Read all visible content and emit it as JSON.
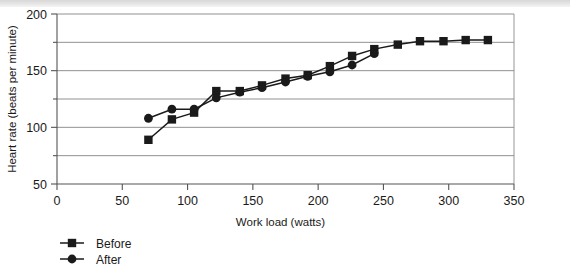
{
  "chart_data": {
    "type": "line",
    "title": "",
    "xlabel": "Work load (watts)",
    "ylabel": "Heart rate (beats per minute)",
    "xlim": [
      0,
      350
    ],
    "ylim": [
      50,
      200
    ],
    "xticks": [
      0,
      50,
      100,
      150,
      200,
      250,
      300,
      350
    ],
    "yticks": [
      50,
      100,
      150,
      200
    ],
    "gridlines_y": [
      75,
      100,
      125,
      150,
      175,
      200
    ],
    "grid": true,
    "legend_position": "below-left",
    "series": [
      {
        "name": "Before",
        "marker": "square",
        "color": "#1a1a1a",
        "points": [
          {
            "x": 70,
            "y": 89
          },
          {
            "x": 88,
            "y": 107
          },
          {
            "x": 105,
            "y": 113
          },
          {
            "x": 122,
            "y": 132
          },
          {
            "x": 140,
            "y": 132
          },
          {
            "x": 157,
            "y": 137
          },
          {
            "x": 175,
            "y": 143
          },
          {
            "x": 192,
            "y": 146
          },
          {
            "x": 209,
            "y": 154
          },
          {
            "x": 226,
            "y": 163
          },
          {
            "x": 243,
            "y": 169
          },
          {
            "x": 261,
            "y": 173
          },
          {
            "x": 278,
            "y": 176
          },
          {
            "x": 296,
            "y": 176
          },
          {
            "x": 313,
            "y": 177
          },
          {
            "x": 330,
            "y": 177
          }
        ]
      },
      {
        "name": "After",
        "marker": "circle",
        "color": "#1a1a1a",
        "points": [
          {
            "x": 70,
            "y": 108
          },
          {
            "x": 88,
            "y": 116
          },
          {
            "x": 105,
            "y": 116
          },
          {
            "x": 122,
            "y": 126
          },
          {
            "x": 140,
            "y": 131
          },
          {
            "x": 157,
            "y": 135
          },
          {
            "x": 175,
            "y": 140
          },
          {
            "x": 192,
            "y": 145
          },
          {
            "x": 209,
            "y": 149
          },
          {
            "x": 226,
            "y": 155
          },
          {
            "x": 243,
            "y": 165
          }
        ]
      }
    ],
    "legend": [
      {
        "label": "Before",
        "marker": "square"
      },
      {
        "label": "After",
        "marker": "circle"
      }
    ]
  }
}
